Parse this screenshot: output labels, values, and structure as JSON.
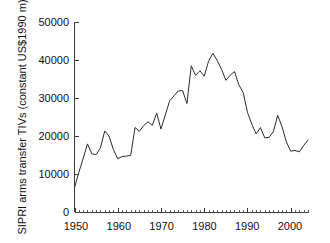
{
  "chart_data": {
    "type": "line",
    "title": "",
    "xlabel": "",
    "ylabel": "SIPRI arms transfer TIVs (constant US$1990 m)",
    "xlim": [
      1950,
      2004
    ],
    "ylim": [
      0,
      50000
    ],
    "grid": false,
    "legend": false,
    "y_ticks": [
      0,
      10000,
      20000,
      30000,
      40000,
      50000
    ],
    "y_tick_labels": [
      "0",
      "10000",
      "20000",
      "30000",
      "40000",
      "50000"
    ],
    "x_ticks": [
      1950,
      1960,
      1970,
      1980,
      1990,
      2000
    ],
    "x_tick_labels": [
      "1950",
      "1960",
      "1970",
      "1980",
      "1990",
      "2000"
    ],
    "x_minor_tick_interval": 1,
    "line_color": "#2b2b2b",
    "axis_color": "#3a3a3a",
    "background_color": "#ffffff",
    "series": [
      {
        "name": "SIPRI arms transfer TIVs",
        "x": [
          1950,
          1951,
          1952,
          1953,
          1954,
          1955,
          1956,
          1957,
          1958,
          1959,
          1960,
          1961,
          1962,
          1963,
          1964,
          1965,
          1966,
          1967,
          1968,
          1969,
          1970,
          1971,
          1972,
          1973,
          1974,
          1975,
          1976,
          1977,
          1978,
          1979,
          1980,
          1981,
          1982,
          1983,
          1984,
          1985,
          1986,
          1987,
          1988,
          1989,
          1990,
          1991,
          1992,
          1993,
          1994,
          1995,
          1996,
          1997,
          1998,
          1999,
          2000,
          2001,
          2002,
          2003,
          2004
        ],
        "values": [
          6500,
          10500,
          14200,
          18000,
          15400,
          15200,
          17000,
          21400,
          20000,
          16500,
          14100,
          14700,
          14800,
          15000,
          22300,
          21300,
          22800,
          23800,
          22900,
          26100,
          21900,
          25600,
          29300,
          30600,
          31900,
          32000,
          28600,
          38500,
          36000,
          37200,
          35800,
          39700,
          41800,
          39900,
          37600,
          34700,
          36000,
          37000,
          33500,
          31500,
          26300,
          23200,
          20600,
          22300,
          19600,
          19700,
          21300,
          25500,
          22500,
          18500,
          16100,
          16300,
          15900,
          17600,
          19000
        ]
      }
    ]
  },
  "axes": {
    "y_label": "SIPRI arms transfer TIVs (constant US$1990 m)"
  }
}
